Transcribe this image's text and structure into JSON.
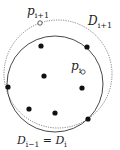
{
  "diagram": {
    "title": "",
    "circles": [
      {
        "id": "D_i_minus_1_equals_D_i",
        "cx": 55,
        "cy": 84,
        "r": 48,
        "style": "solid",
        "color": "#333333"
      },
      {
        "id": "D_i_plus_1",
        "cx": 58,
        "cy": 74,
        "r": 54,
        "style": "dotted",
        "color": "#666666"
      }
    ],
    "filled_points": [
      {
        "x": 41,
        "y": 46
      },
      {
        "x": 87,
        "y": 47
      },
      {
        "x": 44,
        "y": 76
      },
      {
        "x": 82,
        "y": 88
      },
      {
        "x": 8,
        "y": 87
      },
      {
        "x": 29,
        "y": 109
      },
      {
        "x": 55,
        "y": 113
      },
      {
        "x": 88,
        "y": 119
      }
    ],
    "open_points": [
      {
        "name": "p_{i+1}",
        "x": 40,
        "y": 23
      },
      {
        "name": "p_i",
        "x": 83,
        "y": 72
      }
    ],
    "labels": {
      "p_i_plus_1": {
        "base": "p",
        "sub": "i+1"
      },
      "p_i": {
        "base": "p",
        "sub": "i"
      },
      "D_i_plus_1": {
        "base": "D",
        "sub": "i+1"
      },
      "bottom": {
        "base1": "D",
        "sub1": "i−1",
        "eq": " = ",
        "base2": "D",
        "sub2": "i"
      }
    }
  }
}
